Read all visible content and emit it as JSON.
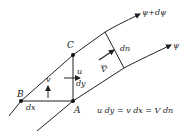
{
  "diagram": {
    "streamlines": {
      "upper_label": "ψ+dψ",
      "lower_label": "ψ"
    },
    "points": {
      "A": "A",
      "B": "B",
      "C": "C"
    },
    "labels": {
      "u": "u",
      "v": "v",
      "dx": "dx",
      "dy": "dy",
      "dn": "dn",
      "V": "V"
    },
    "equation": "u dy = v dx = V dn",
    "colors": {
      "line": "#222222",
      "background": "#ffffff"
    }
  }
}
